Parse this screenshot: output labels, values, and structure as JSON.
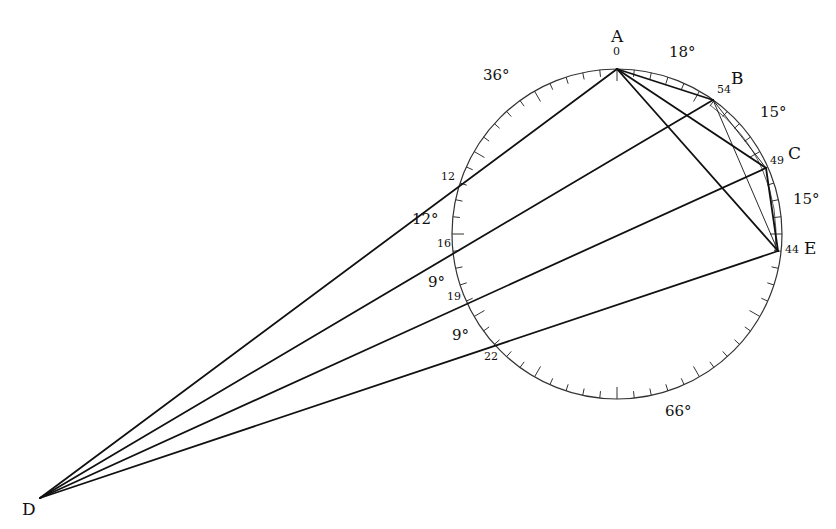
{
  "diagram": {
    "title": "",
    "circle": {
      "cx": 617,
      "cy": 234,
      "r": 165,
      "stroke": "#222222",
      "units": 60,
      "major_every": 5
    },
    "points": [
      {
        "id": "A",
        "label": "A",
        "unit": 0,
        "x": 617,
        "y": 69,
        "label_x": 611,
        "label_y": 28,
        "num_label": "0",
        "num_x": 613,
        "num_y": 46
      },
      {
        "id": "B",
        "label": "B",
        "unit": 54,
        "x": 713,
        "y": 100,
        "label_x": 731,
        "label_y": 70,
        "num_label": "54",
        "num_x": 717,
        "num_y": 84
      },
      {
        "id": "C",
        "label": "C",
        "unit": 49,
        "x": 766,
        "y": 168,
        "label_x": 788,
        "label_y": 145,
        "num_label": "49",
        "num_x": 770,
        "num_y": 155
      },
      {
        "id": "E",
        "label": "E",
        "unit": 44,
        "x": 778,
        "y": 251,
        "label_x": 804,
        "label_y": 240,
        "num_label": "44",
        "num_x": 785,
        "num_y": 244
      },
      {
        "id": "D",
        "label": "D",
        "unit": null,
        "x": 40,
        "y": 498,
        "label_x": 22,
        "label_y": 501
      }
    ],
    "intersections": [
      {
        "num_label": "12",
        "unit": 12,
        "x": 461,
        "y": 184,
        "num_x": 441,
        "num_y": 171
      },
      {
        "num_label": "16",
        "unit": 16,
        "x": 455,
        "y": 250,
        "num_x": 437,
        "num_y": 238
      },
      {
        "num_label": "19",
        "unit": 19,
        "x": 468,
        "y": 303,
        "num_x": 447,
        "num_y": 291
      },
      {
        "num_label": "22",
        "unit": 22,
        "x": 497,
        "y": 345,
        "num_x": 484,
        "num_y": 351
      }
    ],
    "angle_labels": [
      {
        "text": "36°",
        "x": 483,
        "y": 68
      },
      {
        "text": "18°",
        "x": 669,
        "y": 45
      },
      {
        "text": "15°",
        "x": 760,
        "y": 105
      },
      {
        "text": "15°",
        "x": 793,
        "y": 192
      },
      {
        "text": "12°",
        "x": 412,
        "y": 212
      },
      {
        "text": "9°",
        "x": 428,
        "y": 275
      },
      {
        "text": "9°",
        "x": 452,
        "y": 328
      },
      {
        "text": "66°",
        "x": 665,
        "y": 404
      }
    ],
    "segments": [
      {
        "from": "D",
        "to": "A",
        "weight": "thick"
      },
      {
        "from": "D",
        "to": "B",
        "weight": "thick"
      },
      {
        "from": "D",
        "to": "C",
        "weight": "thick"
      },
      {
        "from": "D",
        "to": "E",
        "weight": "thick"
      },
      {
        "from": "A",
        "to": "B",
        "weight": "thick"
      },
      {
        "from": "A",
        "to": "C",
        "weight": "thick"
      },
      {
        "from": "A",
        "to": "E",
        "weight": "thick"
      },
      {
        "from": "C",
        "to": "E",
        "weight": "thick"
      },
      {
        "from": "B",
        "to": "C",
        "weight": "thin"
      },
      {
        "from": "B",
        "to": "E",
        "weight": "thin"
      }
    ],
    "colors": {
      "line": "#111111",
      "circle": "#333333",
      "text": "#111111",
      "background": "#ffffff"
    }
  }
}
